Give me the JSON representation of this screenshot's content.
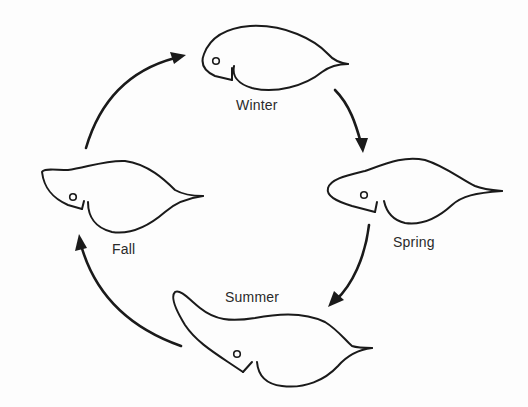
{
  "diagram": {
    "type": "cycle",
    "stroke_color": "#1a1a1a",
    "background_color": "#fdfdfd",
    "stages": [
      {
        "id": "winter",
        "label": "Winter"
      },
      {
        "id": "spring",
        "label": "Spring"
      },
      {
        "id": "summer",
        "label": "Summer"
      },
      {
        "id": "fall",
        "label": "Fall"
      }
    ],
    "arrows": [
      {
        "from": "fall",
        "to": "winter",
        "direction": "clockwise"
      },
      {
        "from": "winter",
        "to": "spring",
        "direction": "clockwise"
      },
      {
        "from": "spring",
        "to": "summer",
        "direction": "clockwise"
      },
      {
        "from": "summer",
        "to": "fall",
        "direction": "clockwise"
      }
    ]
  }
}
